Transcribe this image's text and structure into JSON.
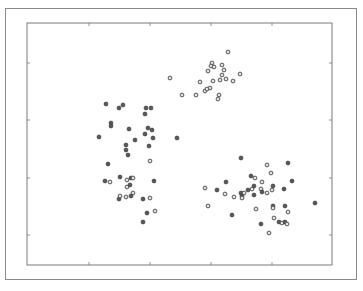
{
  "chart_data": {
    "type": "scatter",
    "title": "",
    "xlabel": "",
    "ylabel": "",
    "grid": false,
    "legend": null,
    "plot_area_px": {
      "left": 27,
      "top": 23,
      "right": 332,
      "bottom": 265
    },
    "x_ticks_px": [
      89,
      150,
      211,
      272
    ],
    "y_ticks_px": [
      63,
      120,
      178,
      235
    ],
    "tick_labels": [],
    "series": [
      {
        "name": "cluster-top",
        "style": "hollow",
        "points": [
          [
            228,
            52
          ],
          [
            212,
            63
          ],
          [
            211,
            66
          ],
          [
            214,
            67
          ],
          [
            222,
            65
          ],
          [
            224,
            70
          ],
          [
            208,
            71
          ],
          [
            222,
            75
          ],
          [
            220,
            80
          ],
          [
            240,
            74
          ],
          [
            213,
            81
          ],
          [
            226,
            79
          ],
          [
            233,
            81
          ],
          [
            200,
            82
          ],
          [
            210,
            88
          ],
          [
            170,
            78
          ],
          [
            182,
            95
          ],
          [
            196,
            95
          ],
          [
            205,
            91
          ],
          [
            207,
            89
          ],
          [
            219,
            95
          ],
          [
            218,
            99
          ]
        ]
      },
      {
        "name": "cluster-left",
        "style": "filled",
        "points": [
          [
            106,
            104
          ],
          [
            119,
            108
          ],
          [
            123,
            105
          ],
          [
            146,
            108
          ],
          [
            151,
            108
          ],
          [
            145,
            114
          ],
          [
            111,
            123
          ],
          [
            111,
            126
          ],
          [
            129,
            129
          ],
          [
            148,
            128
          ],
          [
            152,
            130
          ],
          [
            99,
            137
          ],
          [
            135,
            140
          ],
          [
            145,
            134
          ],
          [
            153,
            138
          ],
          [
            177,
            138
          ],
          [
            126,
            145
          ],
          [
            149,
            146
          ],
          [
            126,
            150
          ],
          [
            128,
            155
          ]
        ]
      },
      {
        "name": "cluster-left-lower",
        "style": "mixed",
        "points": [
          [
            108,
            164
          ],
          [
            150,
            161
          ],
          [
            105,
            181
          ],
          [
            110,
            182
          ],
          [
            120,
            177
          ],
          [
            127,
            180
          ],
          [
            131,
            178
          ],
          [
            133,
            178
          ],
          [
            154,
            181
          ],
          [
            127,
            187
          ],
          [
            130,
            185
          ],
          [
            133,
            193
          ],
          [
            131,
            196
          ],
          [
            126,
            197
          ],
          [
            119,
            199
          ],
          [
            120,
            196
          ],
          [
            143,
            199
          ],
          [
            150,
            198
          ],
          [
            147,
            213
          ],
          [
            155,
            211
          ],
          [
            143,
            222
          ]
        ]
      },
      {
        "name": "cluster-bottom-right",
        "style": "mixed",
        "points": [
          [
            241,
            158
          ],
          [
            267,
            165
          ],
          [
            288,
            163
          ],
          [
            271,
            173
          ],
          [
            251,
            176
          ],
          [
            255,
            178
          ],
          [
            226,
            182
          ],
          [
            262,
            182
          ],
          [
            292,
            181
          ],
          [
            205,
            188
          ],
          [
            217,
            190
          ],
          [
            225,
            194
          ],
          [
            241,
            193
          ],
          [
            252,
            189
          ],
          [
            254,
            186
          ],
          [
            244,
            193
          ],
          [
            248,
            190
          ],
          [
            261,
            189
          ],
          [
            262,
            192
          ],
          [
            267,
            193
          ],
          [
            273,
            186
          ],
          [
            272,
            190
          ],
          [
            284,
            189
          ],
          [
            234,
            197
          ],
          [
            242,
            196
          ],
          [
            242,
            198
          ],
          [
            254,
            195
          ],
          [
            208,
            206
          ],
          [
            232,
            215
          ],
          [
            256,
            209
          ],
          [
            273,
            206
          ],
          [
            273,
            208
          ],
          [
            285,
            206
          ],
          [
            288,
            212
          ],
          [
            315,
            203
          ],
          [
            274,
            218
          ],
          [
            279,
            222
          ],
          [
            282,
            223
          ],
          [
            285,
            222
          ],
          [
            287,
            224
          ],
          [
            261,
            224
          ],
          [
            269,
            233
          ]
        ]
      }
    ]
  },
  "colors": {
    "frame": "#8a8a8a",
    "axis": "#7a7a7a",
    "point_fill": "#5a5a5a",
    "point_stroke": "#444444",
    "hollow_fill": "#e6e6e6"
  }
}
